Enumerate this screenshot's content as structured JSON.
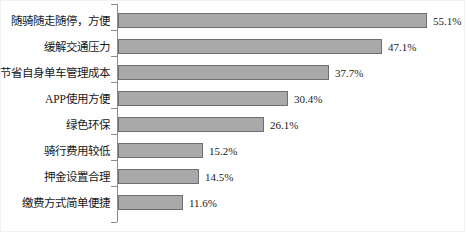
{
  "chart_data": {
    "type": "bar",
    "orientation": "horizontal",
    "title": "",
    "subtitle": "",
    "xlabel": "",
    "ylabel": "",
    "grid": false,
    "legend": null,
    "xlim": [
      0,
      62
    ],
    "value_suffix": "%",
    "categories": [
      "随骑随走随停，方便",
      "缓解交通压力",
      "节省自身单车管理成本",
      "APP使用方便",
      "绿色环保",
      "骑行费用较低",
      "押金设置合理",
      "缴费方式简单便捷"
    ],
    "values": [
      55.1,
      47.1,
      37.7,
      30.4,
      26.1,
      15.2,
      14.5,
      11.6
    ],
    "value_labels": [
      "55.1%",
      "47.1%",
      "37.7%",
      "30.4%",
      "26.1%",
      "15.2%",
      "14.5%",
      "11.6%"
    ],
    "colors": {
      "bar_fill": "#a9a9a9",
      "bar_stroke": "#6e6e6e",
      "axis": "#8c8c8c",
      "text": "#1a1a1a",
      "background": "#ffffff",
      "frame": "#f2f2f2"
    }
  },
  "layout": {
    "axis_x_px": 118,
    "row_height_px": 26,
    "first_row_top_px": 8,
    "px_per_percent": 5.6,
    "label_gap_px": 6
  }
}
